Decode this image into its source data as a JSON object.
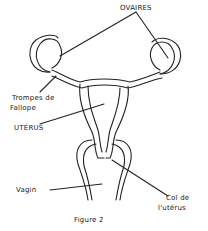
{
  "diagram": {
    "caption": "Figure 2",
    "labels": {
      "ovaires": "OVAIRES",
      "trompes_line1": "Trompes de",
      "trompes_line2": "Fallope",
      "uterus": "UTÉRUS",
      "vagin": "Vagin",
      "col_line1": "Col de",
      "col_line2": "l'utérus"
    }
  }
}
